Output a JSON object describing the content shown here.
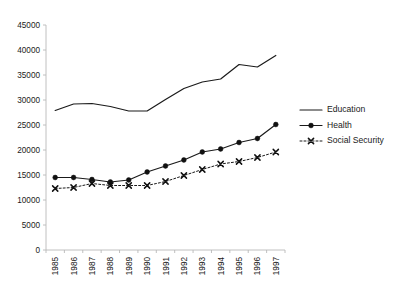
{
  "chart_data": {
    "type": "line",
    "title": "",
    "subtitle": "",
    "xlabel": "",
    "ylabel": "",
    "x": [
      1985,
      1986,
      1987,
      1988,
      1989,
      1990,
      1991,
      1992,
      1993,
      1994,
      1995,
      1996,
      1997
    ],
    "categories": [
      "1985",
      "1986",
      "1987",
      "1988",
      "1989",
      "1990",
      "1991",
      "1992",
      "1993",
      "1994",
      "1995",
      "1996",
      "1997"
    ],
    "xtick_labels": [
      "1985",
      "1986",
      "1987",
      "1988",
      "1989",
      "1990",
      "1991",
      "1992",
      "1993",
      "1994",
      "1995",
      "1996",
      "1997"
    ],
    "ytick_labels": [
      "0",
      "5000",
      "10000",
      "15000",
      "20000",
      "25000",
      "30000",
      "35000",
      "40000",
      "45000"
    ],
    "yticks": [
      0,
      5000,
      10000,
      15000,
      20000,
      25000,
      30000,
      35000,
      40000,
      45000
    ],
    "ylim": [
      0,
      45000
    ],
    "grid": false,
    "legend_position": "right",
    "series": [
      {
        "name": "Education",
        "marker": "none",
        "line_style": "solid",
        "color": "#1a1a1a",
        "values": [
          27900,
          29200,
          29300,
          28700,
          27800,
          27800,
          30100,
          32300,
          33600,
          34200,
          37100,
          36600,
          38900
        ]
      },
      {
        "name": "Health",
        "marker": "circle",
        "line_style": "solid",
        "color": "#111111",
        "values": [
          14500,
          14500,
          14100,
          13600,
          14000,
          15600,
          16800,
          18000,
          19600,
          20200,
          21500,
          22300,
          25100
        ]
      },
      {
        "name": "Social Security",
        "marker": "x",
        "line_style": "dotted",
        "color": "#111111",
        "values": [
          12300,
          12500,
          13300,
          12900,
          12900,
          12900,
          13700,
          14900,
          16100,
          17200,
          17700,
          18500,
          19600
        ]
      }
    ]
  },
  "legend": {
    "entries": [
      {
        "label": "Education"
      },
      {
        "label": "Health"
      },
      {
        "label": "Social Security"
      }
    ]
  },
  "axes": {
    "y_axis_name": "value-axis",
    "x_axis_name": "year-axis"
  }
}
